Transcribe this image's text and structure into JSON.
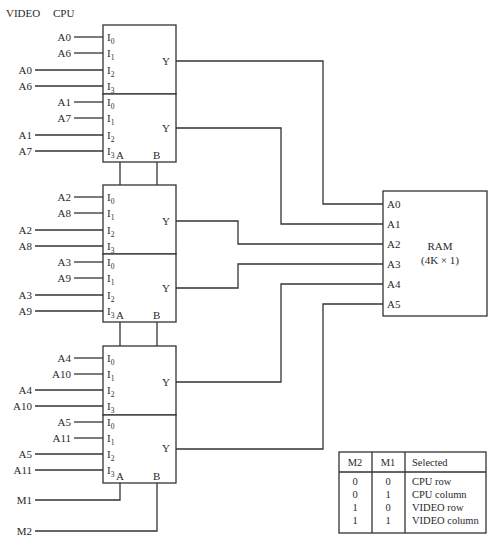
{
  "header": {
    "video_label": "VIDEO",
    "cpu_label": "CPU"
  },
  "muxes": [
    {
      "inputs": [
        {
          "inputs": [
            "A0",
            "A6",
            "A0",
            "A6"
          ]
        },
        {
          "inputs": [
            "A1",
            "A7",
            "A1",
            "A7"
          ]
        }
      ]
    },
    {
      "inputs": [
        {
          "inputs": [
            "A2",
            "A8",
            "A2",
            "A8"
          ]
        },
        {
          "inputs": [
            "A3",
            "A9",
            "A3",
            "A9"
          ]
        }
      ]
    },
    {
      "inputs": [
        {
          "inputs": [
            "A4",
            "A10",
            "A4",
            "A10"
          ]
        },
        {
          "inputs": [
            "A5",
            "A11",
            "A5",
            "A11"
          ]
        }
      ]
    }
  ],
  "mux_pins": {
    "i": "I",
    "subs": [
      "0",
      "1",
      "2",
      "3"
    ],
    "y": "Y",
    "a": "A",
    "b": "B"
  },
  "selects": {
    "m1": "M1",
    "m2": "M2"
  },
  "ram": {
    "title": "RAM",
    "size": "(4K × 1)",
    "pins": [
      "A0",
      "A1",
      "A2",
      "A3",
      "A4",
      "A5"
    ]
  },
  "truth_table": {
    "headers": [
      "M2",
      "M1",
      "Selected"
    ],
    "rows": [
      [
        "0",
        "0",
        "CPU row"
      ],
      [
        "0",
        "1",
        "CPU column"
      ],
      [
        "1",
        "0",
        "VIDEO row"
      ],
      [
        "1",
        "1",
        "VIDEO column"
      ]
    ]
  }
}
